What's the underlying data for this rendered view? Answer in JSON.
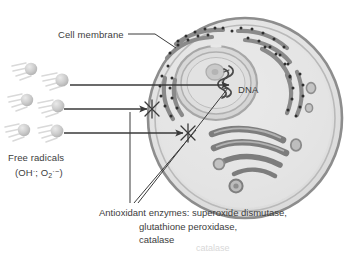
{
  "figure": {
    "type": "biology-diagram",
    "background_color": "#ffffff"
  },
  "labels": {
    "cell_membrane": "Cell membrane",
    "dna": "DNA",
    "free_radicals": "Free radicals",
    "free_radicals_formula_prefix": "(OH",
    "free_radicals_formula_dot1": "·",
    "free_radicals_formula_mid": "; O",
    "free_radicals_formula_sub": "2",
    "free_radicals_formula_dot2": "·",
    "free_radicals_formula_charge": "−",
    "free_radicals_formula_suffix": ")"
  },
  "caption": {
    "line1": "Antioxidant enzymes: superoxide dismutase,",
    "line2": "glutathione peroxidase,",
    "line3": "catalase"
  },
  "bottom_fragment": "catalase",
  "colors": {
    "membrane_outer": "#8d8d8d",
    "membrane_inner": "#b6b6b6",
    "cytoplasm": "#e3e3e3",
    "nucleus_fill": "#dcdcdc",
    "nuclear_envelope": "#a3a3a3",
    "nucleolus": "#c6c6c6",
    "er_cisternae": "#8a8a8a",
    "ribosome_dot": "#2f2f2f",
    "golgi": "#7d7d7d",
    "vesicle": "#9a9a9a",
    "radical_sphere": "#c9c9c9",
    "radical_trail": "#d6d6d6",
    "arrow": "#3a3a3a",
    "leader_line": "#3a3a3a",
    "text": "#3d3d3d"
  },
  "cell": {
    "center_x": 245,
    "center_y": 118,
    "radius_x": 97,
    "radius_y": 100
  },
  "free_radicals": {
    "count": 6,
    "positions": [
      {
        "cx": 31,
        "cy": 69
      },
      {
        "cx": 62,
        "cy": 80
      },
      {
        "cx": 27,
        "cy": 100
      },
      {
        "cx": 58,
        "cy": 106
      },
      {
        "cx": 24,
        "cy": 130
      },
      {
        "cx": 57,
        "cy": 131
      }
    ]
  },
  "arrows": [
    {
      "name": "arrow-to-dna",
      "blocked": false,
      "from_x": 68,
      "from_y": 85,
      "to_x": 231,
      "to_y": 85
    },
    {
      "name": "arrow-blocked-upper",
      "blocked": true,
      "from_x": 62,
      "from_y": 109,
      "to_x": 150,
      "to_y": 109
    },
    {
      "name": "arrow-blocked-lower",
      "blocked": true,
      "from_x": 62,
      "from_y": 133,
      "to_x": 186,
      "to_y": 133
    }
  ],
  "block_marks": [
    {
      "name": "x-mark-upper",
      "x": 152,
      "y": 109
    },
    {
      "name": "x-mark-lower",
      "x": 188,
      "y": 133
    }
  ],
  "organelles": {
    "nucleus": true,
    "nucleolus": true,
    "rough_er": true,
    "golgi_apparatus": true,
    "vesicles": true,
    "dna_strand": true
  }
}
